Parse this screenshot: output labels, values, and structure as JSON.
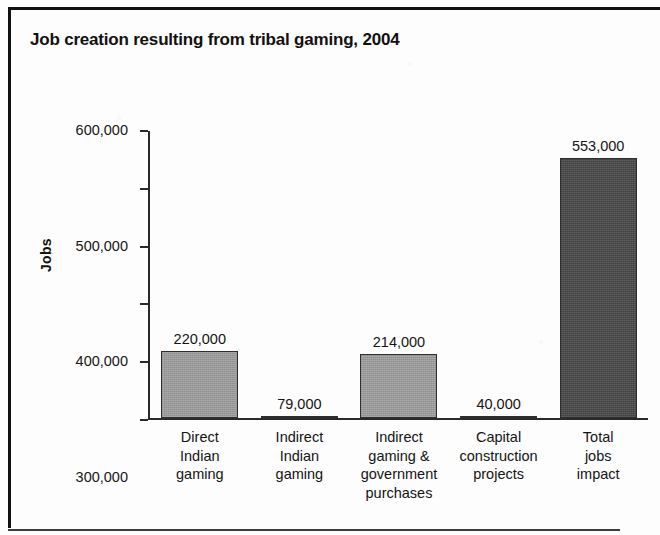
{
  "chart_data": {
    "type": "bar",
    "title": "Job creation resulting from tribal gaming, 2004",
    "xlabel": "",
    "ylabel": "Jobs",
    "ylim": [
      100000,
      600000
    ],
    "ytick_labels": [
      "600,000",
      "500,000",
      "400,000",
      "300,000",
      "200,000",
      "100,000"
    ],
    "ytick_values": [
      600000,
      500000,
      400000,
      300000,
      200000,
      100000
    ],
    "grid": false,
    "legend": "none",
    "categories": [
      "Direct\nIndian\ngaming",
      "Indirect\nIndian\ngaming",
      "Indirect\ngaming &\ngovernment\npurchases",
      "Capital\nconstruction\nprojects",
      "Total\njobs\nimpact"
    ],
    "category_lines": [
      [
        "Direct",
        "Indian",
        "gaming"
      ],
      [
        "Indirect",
        "Indian",
        "gaming"
      ],
      [
        "Indirect",
        "gaming &",
        "government",
        "purchases"
      ],
      [
        "Capital",
        "construction",
        "projects"
      ],
      [
        "Total",
        "jobs",
        "impact"
      ]
    ],
    "values": [
      220000,
      79000,
      214000,
      40000,
      553000
    ],
    "value_labels": [
      "220,000",
      "79,000",
      "214,000",
      "40,000",
      "553,000"
    ],
    "bar_styles": [
      "light",
      "light",
      "light",
      "light",
      "dark"
    ],
    "colors": {
      "bar_light": "#9a9a9a",
      "bar_dark": "#4a4a4a",
      "bar_outline": "#2e2e2e",
      "axis": "#2a2a2a",
      "text": "#141414"
    }
  }
}
